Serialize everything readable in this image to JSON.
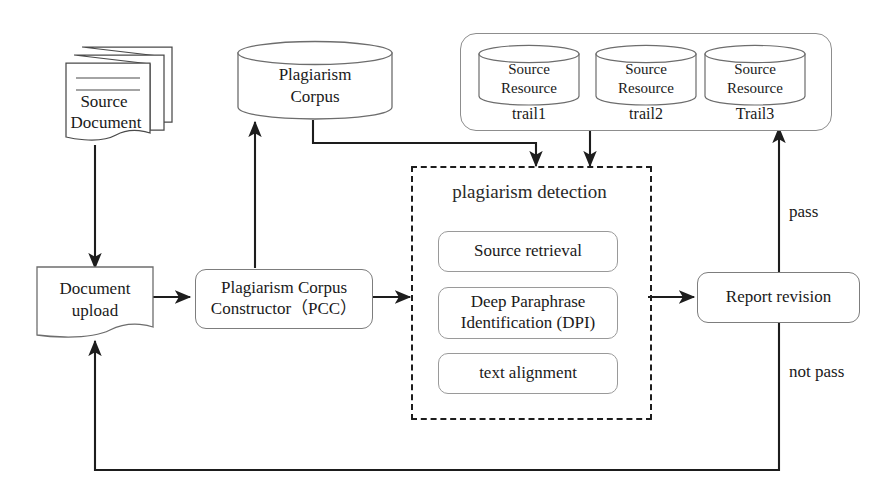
{
  "diagram": {
    "background_color": "#ffffff",
    "line_color": "#1d1d1d",
    "node_border_color": "#8d8d8d"
  },
  "nodes": {
    "source_document": {
      "label": "Source\nDocument",
      "line1": "Source",
      "line2": "Document",
      "shape": "stacked-document"
    },
    "document_upload": {
      "label": "Document\nupload",
      "line1": "Document",
      "line2": "upload",
      "shape": "document"
    },
    "pcc": {
      "label": "Plagiarism Corpus\nConstructor（PCC）",
      "line1": "Plagiarism Corpus",
      "line2": "Constructor（PCC）",
      "shape": "rounded-rect"
    },
    "plagiarism_corpus": {
      "label": "Plagiarism\nCorpus",
      "line1": "Plagiarism",
      "line2": "Corpus",
      "shape": "cylinder"
    },
    "report_revision": {
      "label": "Report revision",
      "shape": "rounded-rect"
    }
  },
  "source_resources": {
    "group_shape": "rounded-rect-group",
    "items": [
      {
        "line1": "Source",
        "line2": "Resource",
        "trail": "trail1"
      },
      {
        "line1": "Source",
        "line2": "Resource",
        "trail": "trail2"
      },
      {
        "line1": "Source",
        "line2": "Resource",
        "trail": "Trail3"
      }
    ]
  },
  "detection_module": {
    "title": "plagiarism detection",
    "shape": "dashed-rect",
    "steps": [
      {
        "label": "Source retrieval"
      },
      {
        "line1": "Deep Paraphrase",
        "line2": "Identification (DPI)"
      },
      {
        "label": "text alignment"
      }
    ]
  },
  "edge_labels": {
    "pass": "pass",
    "not_pass": "not pass"
  }
}
